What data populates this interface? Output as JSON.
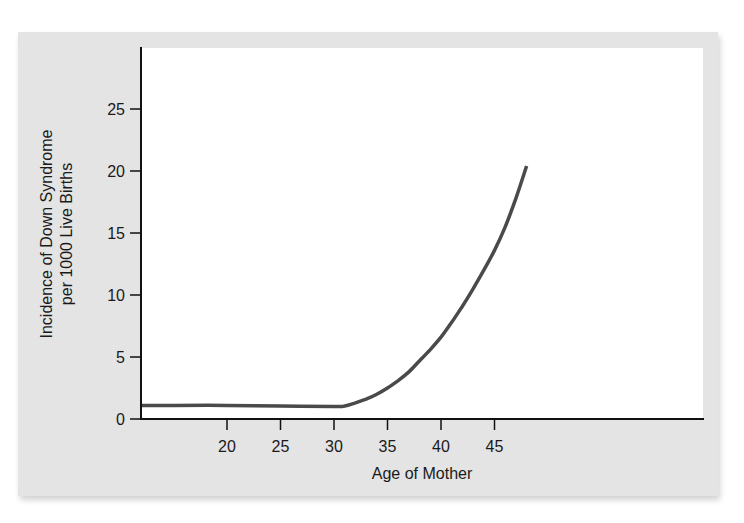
{
  "chart_data": {
    "type": "line",
    "title": "",
    "xlabel": "Age of Mother",
    "ylabel_lines": [
      "Incidence of Down Syndrome",
      "per 1000 Live Births"
    ],
    "ylabel": "Incidence of Down Syndrome per 1000 Live Births",
    "xlim": [
      12,
      50.5
    ],
    "ylim": [
      0,
      29.8
    ],
    "x_ticks": [
      20,
      25,
      30,
      35,
      40,
      45
    ],
    "y_ticks": [
      0,
      5,
      10,
      15,
      20,
      25
    ],
    "grid": false,
    "legend": null,
    "series": [
      {
        "name": "Incidence",
        "color": "#4a4a4a",
        "x": [
          12,
          15,
          20,
          25,
          30,
          31,
          32,
          33,
          34,
          35,
          36,
          37,
          38,
          39,
          40,
          41,
          42,
          43,
          44,
          45,
          46,
          47,
          48
        ],
        "y": [
          1.1,
          1.1,
          1.1,
          1.05,
          1.0,
          1.05,
          1.3,
          1.6,
          2.0,
          2.5,
          3.1,
          3.8,
          4.7,
          5.6,
          6.6,
          7.8,
          9.1,
          10.5,
          12.0,
          13.6,
          15.5,
          17.8,
          20.4
        ]
      }
    ]
  },
  "colors": {
    "panel_bg": "#e4e4e4",
    "plot_bg": "#ffffff",
    "axis": "#111111",
    "curve": "#4a4a4a"
  }
}
